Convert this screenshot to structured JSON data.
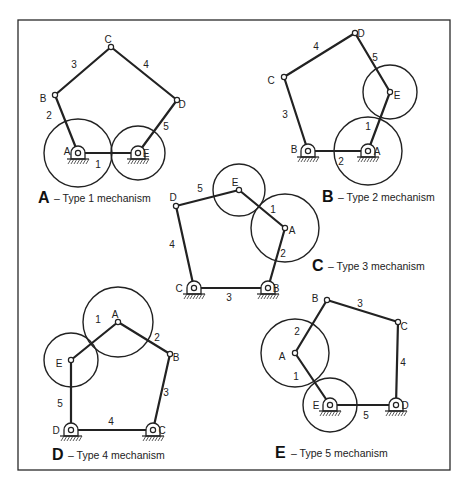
{
  "figure": {
    "frame": {
      "x": 18,
      "y": 20,
      "w": 432,
      "h": 450
    },
    "panels": [
      {
        "id": "A",
        "caption_letter": "A",
        "caption_text": "– Type 1 mechanism",
        "caption_pos": [
          38,
          203
        ],
        "joints": {
          "A": {
            "x": 78,
            "y": 153,
            "ground": true,
            "label_dx": -11,
            "label_dy": -2
          },
          "B": {
            "x": 55,
            "y": 95,
            "ground": false,
            "label_dx": -12,
            "label_dy": 3
          },
          "C": {
            "x": 111,
            "y": 47,
            "ground": false,
            "label_dx": -3,
            "label_dy": -8
          },
          "D": {
            "x": 177,
            "y": 100,
            "ground": false,
            "label_dx": 5,
            "label_dy": 4
          },
          "E": {
            "x": 138,
            "y": 153,
            "ground": true,
            "label_dx": 8,
            "label_dy": 0
          }
        },
        "links": [
          {
            "from": "A",
            "to": "E",
            "num": "1",
            "lx": 98,
            "ly": 168
          },
          {
            "from": "A",
            "to": "B",
            "num": "2",
            "lx": 49,
            "ly": 119
          },
          {
            "from": "B",
            "to": "C",
            "num": "3",
            "lx": 74,
            "ly": 68
          },
          {
            "from": "C",
            "to": "D",
            "num": "4",
            "lx": 146,
            "ly": 68
          },
          {
            "from": "D",
            "to": "E",
            "num": "5",
            "lx": 166,
            "ly": 130
          }
        ],
        "circles": [
          {
            "cx": 78,
            "cy": 153,
            "r": 34
          },
          {
            "cx": 138,
            "cy": 153,
            "r": 27
          }
        ]
      },
      {
        "id": "B",
        "caption_letter": "B",
        "caption_text": "– Type 2 mechanism",
        "caption_pos": [
          322,
          202
        ],
        "joints": {
          "A": {
            "x": 368,
            "y": 151,
            "ground": true,
            "label_dx": 9,
            "label_dy": 0
          },
          "B": {
            "x": 308,
            "y": 151,
            "ground": true,
            "label_dx": -14,
            "label_dy": -2
          },
          "C": {
            "x": 284,
            "y": 77,
            "ground": false,
            "label_dx": -13,
            "label_dy": 3
          },
          "D": {
            "x": 355,
            "y": 33,
            "ground": false,
            "label_dx": 6,
            "label_dy": 0
          },
          "E": {
            "x": 390,
            "y": 92,
            "ground": false,
            "label_dx": 7,
            "label_dy": 3
          }
        },
        "links": [
          {
            "from": "A",
            "to": "E",
            "num": "1",
            "lx": 368,
            "ly": 130
          },
          {
            "from": "A",
            "to": "B",
            "num": "2",
            "lx": 341,
            "ly": 165
          },
          {
            "from": "B",
            "to": "C",
            "num": "3",
            "lx": 285,
            "ly": 118
          },
          {
            "from": "C",
            "to": "D",
            "num": "4",
            "lx": 316,
            "ly": 50
          },
          {
            "from": "D",
            "to": "E",
            "num": "5",
            "lx": 375,
            "ly": 61
          }
        ],
        "circles": [
          {
            "cx": 368,
            "cy": 151,
            "r": 34
          },
          {
            "cx": 390,
            "cy": 92,
            "r": 27
          }
        ]
      },
      {
        "id": "C",
        "caption_letter": "C",
        "caption_text": "– Type 3 mechanism",
        "caption_pos": [
          312,
          271
        ],
        "joints": {
          "A": {
            "x": 285,
            "y": 228,
            "ground": false,
            "label_dx": 7,
            "label_dy": 2
          },
          "B": {
            "x": 268,
            "y": 288,
            "ground": true,
            "label_dx": 8,
            "label_dy": 0
          },
          "C": {
            "x": 194,
            "y": 288,
            "ground": true,
            "label_dx": -15,
            "label_dy": 0
          },
          "D": {
            "x": 176,
            "y": 206,
            "ground": false,
            "label_dx": -3,
            "label_dy": -9
          },
          "E": {
            "x": 239,
            "y": 190,
            "ground": false,
            "label_dx": -4,
            "label_dy": -8
          }
        },
        "links": [
          {
            "from": "E",
            "to": "A",
            "num": "1",
            "lx": 273,
            "ly": 213
          },
          {
            "from": "A",
            "to": "B",
            "num": "2",
            "lx": 283,
            "ly": 257
          },
          {
            "from": "C",
            "to": "B",
            "num": "3",
            "lx": 229,
            "ly": 301
          },
          {
            "from": "D",
            "to": "C",
            "num": "4",
            "lx": 172,
            "ly": 248
          },
          {
            "from": "D",
            "to": "E",
            "num": "5",
            "lx": 200,
            "ly": 192
          }
        ],
        "circles": [
          {
            "cx": 285,
            "cy": 228,
            "r": 34
          },
          {
            "cx": 239,
            "cy": 190,
            "r": 26
          }
        ]
      },
      {
        "id": "D",
        "caption_letter": "D",
        "caption_text": "– Type 4 mechanism",
        "caption_pos": [
          52,
          460
        ],
        "joints": {
          "A": {
            "x": 118,
            "y": 322,
            "ground": false,
            "label_dx": -3,
            "label_dy": -8
          },
          "B": {
            "x": 170,
            "y": 354,
            "ground": false,
            "label_dx": 6,
            "label_dy": 3
          },
          "C": {
            "x": 153,
            "y": 430,
            "ground": true,
            "label_dx": 9,
            "label_dy": 0
          },
          "D": {
            "x": 71,
            "y": 430,
            "ground": true,
            "label_dx": -15,
            "label_dy": 0
          },
          "E": {
            "x": 71,
            "y": 360,
            "ground": false,
            "label_dx": -12,
            "label_dy": 3
          }
        },
        "links": [
          {
            "from": "E",
            "to": "A",
            "num": "1",
            "lx": 98,
            "ly": 323
          },
          {
            "from": "A",
            "to": "B",
            "num": "2",
            "lx": 157,
            "ly": 341
          },
          {
            "from": "B",
            "to": "C",
            "num": "3",
            "lx": 166,
            "ly": 396
          },
          {
            "from": "D",
            "to": "C",
            "num": "4",
            "lx": 111,
            "ly": 425
          },
          {
            "from": "E",
            "to": "D",
            "num": "5",
            "lx": 60,
            "ly": 407
          }
        ],
        "circles": [
          {
            "cx": 118,
            "cy": 322,
            "r": 35
          },
          {
            "cx": 71,
            "cy": 360,
            "r": 27
          }
        ]
      },
      {
        "id": "E",
        "caption_letter": "E",
        "caption_text": "– Type 5 mechanism",
        "caption_pos": [
          275,
          458
        ],
        "joints": {
          "A": {
            "x": 295,
            "y": 353,
            "ground": false,
            "label_dx": -13,
            "label_dy": 3
          },
          "B": {
            "x": 327,
            "y": 300,
            "ground": false,
            "label_dx": -12,
            "label_dy": -2
          },
          "C": {
            "x": 398,
            "y": 322,
            "ground": false,
            "label_dx": 6,
            "label_dy": 4
          },
          "D": {
            "x": 396,
            "y": 405,
            "ground": true,
            "label_dx": 9,
            "label_dy": 0
          },
          "E": {
            "x": 330,
            "y": 405,
            "ground": true,
            "label_dx": -14,
            "label_dy": 0
          }
        },
        "links": [
          {
            "from": "A",
            "to": "E",
            "num": "1",
            "lx": 296,
            "ly": 380
          },
          {
            "from": "A",
            "to": "B",
            "num": "2",
            "lx": 297,
            "ly": 335
          },
          {
            "from": "B",
            "to": "C",
            "num": "3",
            "lx": 360,
            "ly": 307
          },
          {
            "from": "C",
            "to": "D",
            "num": "4",
            "lx": 403,
            "ly": 366
          },
          {
            "from": "E",
            "to": "D",
            "num": "5",
            "lx": 366,
            "ly": 419
          }
        ],
        "circles": [
          {
            "cx": 295,
            "cy": 353,
            "r": 34
          },
          {
            "cx": 330,
            "cy": 405,
            "r": 27
          }
        ]
      }
    ]
  }
}
